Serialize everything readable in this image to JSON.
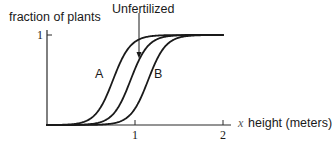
{
  "chart_data": {
    "type": "line",
    "title": "",
    "ylabel": "fraction of plants",
    "xlabel": "height (meters)",
    "x_axis_symbol": "x",
    "xlim": [
      0,
      2.1
    ],
    "ylim": [
      0,
      1
    ],
    "x_ticks": [
      1,
      2
    ],
    "x_tick_labels": [
      "1",
      "2"
    ],
    "y_ticks": [
      1
    ],
    "y_tick_labels": [
      "1"
    ],
    "grid": false,
    "legend": "none (curves labeled inline)",
    "annotations": [
      {
        "text": "Unfertilized",
        "type": "arrow-label",
        "points_to_series": "Unfertilized"
      },
      {
        "text": "A",
        "type": "inline-label",
        "series": "A"
      },
      {
        "text": "B",
        "type": "inline-label",
        "series": "B"
      }
    ],
    "series": [
      {
        "name": "A",
        "shape": "cumulative sigmoid",
        "midpoint": 0.75,
        "steepness": 10
      },
      {
        "name": "Unfertilized",
        "shape": "cumulative sigmoid",
        "midpoint": 0.95,
        "steepness": 10
      },
      {
        "name": "B",
        "shape": "cumulative sigmoid",
        "midpoint": 1.15,
        "steepness": 10
      }
    ]
  },
  "labels": {
    "ylabel": "fraction of plants",
    "unfertilized": "Unfertilized",
    "curve_a": "A",
    "curve_b": "B",
    "y_tick_1": "1",
    "x_tick_1": "1",
    "x_tick_2": "2",
    "x_symbol": "x",
    "xlabel": "height (meters)"
  },
  "style": {
    "line_color": "#1a1a1a",
    "axis_color": "#2a2a2a"
  }
}
